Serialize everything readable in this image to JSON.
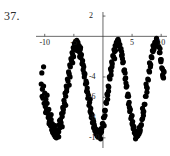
{
  "problem": {
    "number": "37."
  },
  "chart_data": {
    "type": "scatter",
    "title": "",
    "xlabel": "",
    "ylabel": "",
    "xlim": [
      -11.5,
      11.0
    ],
    "ylim": [
      -11.0,
      2.4
    ],
    "grid": false,
    "legend": null,
    "axis_lines": {
      "x_axis_at_y": 0,
      "y_axis_at_x": 0
    },
    "xticks": [
      -10,
      -5,
      5,
      10
    ],
    "xtick_labels": [
      "-10",
      "-5",
      "5",
      "10"
    ],
    "yticks": [
      2,
      -4,
      -6,
      -8,
      -10
    ],
    "ytick_labels": [
      "2",
      "-4",
      "-6",
      "-8",
      "-10"
    ],
    "marker": {
      "shape": "circle",
      "color": "#000000",
      "size": 2.6
    },
    "model": {
      "form": "a*sin(b*x + c) + d",
      "amplitude": 5,
      "period": 5,
      "offset": -5
    },
    "points": [
      [
        -10.6,
        -4.7
      ],
      [
        -10.5,
        -3.6
      ],
      [
        -10.4,
        -5.2
      ],
      [
        -10.3,
        -6.1
      ],
      [
        -10.2,
        -4.9
      ],
      [
        -10.1,
        -6.6
      ],
      [
        -10.0,
        -5.6
      ],
      [
        -9.9,
        -6.9
      ],
      [
        -9.8,
        -6.2
      ],
      [
        -9.7,
        -7.3
      ],
      [
        -9.6,
        -6.6
      ],
      [
        -9.5,
        -7.6
      ],
      [
        -9.4,
        -8.0
      ],
      [
        -9.3,
        -7.2
      ],
      [
        -9.2,
        -8.4
      ],
      [
        -9.1,
        -7.9
      ],
      [
        -9.0,
        -8.8
      ],
      [
        -8.9,
        -8.2
      ],
      [
        -8.8,
        -9.2
      ],
      [
        -8.7,
        -8.6
      ],
      [
        -8.6,
        -9.5
      ],
      [
        -8.5,
        -9.0
      ],
      [
        -8.4,
        -9.7
      ],
      [
        -8.3,
        -9.3
      ],
      [
        -8.2,
        -9.9
      ],
      [
        -8.1,
        -9.4
      ],
      [
        -8.0,
        -10.0
      ],
      [
        -7.9,
        -9.6
      ],
      [
        -7.8,
        -9.8
      ],
      [
        -7.7,
        -9.2
      ],
      [
        -7.6,
        -9.4
      ],
      [
        -7.5,
        -8.7
      ],
      [
        -7.4,
        -9.0
      ],
      [
        -7.3,
        -8.2
      ],
      [
        -7.2,
        -8.5
      ],
      [
        -7.1,
        -7.6
      ],
      [
        -7.0,
        -7.9
      ],
      [
        -6.9,
        -7.0
      ],
      [
        -6.8,
        -7.2
      ],
      [
        -6.7,
        -6.3
      ],
      [
        -6.6,
        -6.6
      ],
      [
        -6.5,
        -5.6
      ],
      [
        -6.4,
        -5.9
      ],
      [
        -6.3,
        -4.9
      ],
      [
        -6.2,
        -5.1
      ],
      [
        -6.1,
        -4.2
      ],
      [
        -6.0,
        -4.4
      ],
      [
        -5.9,
        -3.5
      ],
      [
        -5.8,
        -3.7
      ],
      [
        -5.7,
        -2.8
      ],
      [
        -5.6,
        -3.0
      ],
      [
        -5.5,
        -2.2
      ],
      [
        -5.4,
        -2.4
      ],
      [
        -5.3,
        -1.6
      ],
      [
        -5.2,
        -1.8
      ],
      [
        -5.1,
        -1.1
      ],
      [
        -5.0,
        -1.3
      ],
      [
        -4.9,
        -0.7
      ],
      [
        -4.8,
        -0.9
      ],
      [
        -4.7,
        -0.5
      ],
      [
        -4.6,
        -0.8
      ],
      [
        -4.5,
        -0.4
      ],
      [
        -4.4,
        -0.9
      ],
      [
        -4.3,
        -0.6
      ],
      [
        -4.2,
        -1.2
      ],
      [
        -4.1,
        -0.9
      ],
      [
        -4.0,
        -1.6
      ],
      [
        -3.9,
        -1.3
      ],
      [
        -3.8,
        -2.1
      ],
      [
        -3.7,
        -1.8
      ],
      [
        -3.6,
        -2.7
      ],
      [
        -3.5,
        -2.4
      ],
      [
        -3.4,
        -3.3
      ],
      [
        -3.3,
        -3.0
      ],
      [
        -3.2,
        -4.0
      ],
      [
        -3.1,
        -3.7
      ],
      [
        -3.0,
        -4.7
      ],
      [
        -2.9,
        -4.4
      ],
      [
        -2.8,
        -5.4
      ],
      [
        -2.7,
        -5.1
      ],
      [
        -2.6,
        -6.1
      ],
      [
        -2.5,
        -5.8
      ],
      [
        -2.4,
        -6.8
      ],
      [
        -2.3,
        -6.5
      ],
      [
        -2.2,
        -7.4
      ],
      [
        -2.1,
        -7.1
      ],
      [
        -2.0,
        -8.0
      ],
      [
        -1.9,
        -7.7
      ],
      [
        -1.8,
        -8.5
      ],
      [
        -1.7,
        -8.2
      ],
      [
        -1.6,
        -9.0
      ],
      [
        -1.5,
        -8.7
      ],
      [
        -1.4,
        -9.3
      ],
      [
        -1.3,
        -9.1
      ],
      [
        -1.2,
        -9.6
      ],
      [
        -1.1,
        -9.4
      ],
      [
        -1.0,
        -9.8
      ],
      [
        -0.9,
        -9.6
      ],
      [
        -0.8,
        -9.9
      ],
      [
        -0.7,
        -9.7
      ],
      [
        -0.6,
        -9.8
      ],
      [
        -0.5,
        -9.5
      ],
      [
        -0.4,
        -9.5
      ],
      [
        -0.3,
        -9.1
      ],
      [
        -0.2,
        -9.1
      ],
      [
        -0.1,
        -8.6
      ],
      [
        0.0,
        -8.6
      ],
      [
        0.1,
        -8.0
      ],
      [
        0.2,
        -8.0
      ],
      [
        0.3,
        -7.3
      ],
      [
        0.4,
        -7.3
      ],
      [
        0.5,
        -6.5
      ],
      [
        0.6,
        -6.6
      ],
      [
        0.7,
        -5.7
      ],
      [
        0.8,
        -5.8
      ],
      [
        0.9,
        -4.9
      ],
      [
        1.0,
        -5.0
      ],
      [
        1.1,
        -4.0
      ],
      [
        1.2,
        -4.2
      ],
      [
        1.3,
        -3.2
      ],
      [
        1.4,
        -3.4
      ],
      [
        1.5,
        -2.5
      ],
      [
        1.6,
        -2.7
      ],
      [
        1.7,
        -1.9
      ],
      [
        1.8,
        -2.0
      ],
      [
        1.9,
        -1.3
      ],
      [
        2.0,
        -1.5
      ],
      [
        2.1,
        -0.9
      ],
      [
        2.2,
        -1.0
      ],
      [
        2.3,
        -0.6
      ],
      [
        2.4,
        -0.7
      ],
      [
        2.5,
        -0.4
      ],
      [
        2.6,
        -0.6
      ],
      [
        2.7,
        -0.5
      ],
      [
        2.8,
        -0.8
      ],
      [
        2.9,
        -0.8
      ],
      [
        3.0,
        -1.3
      ],
      [
        3.1,
        -1.2
      ],
      [
        3.2,
        -1.9
      ],
      [
        3.3,
        -1.8
      ],
      [
        3.4,
        -2.6
      ],
      [
        3.5,
        -2.5
      ],
      [
        3.6,
        -3.4
      ],
      [
        3.7,
        -3.3
      ],
      [
        3.8,
        -4.2
      ],
      [
        3.9,
        -4.1
      ],
      [
        4.0,
        -5.0
      ],
      [
        4.1,
        -4.9
      ],
      [
        4.2,
        -5.9
      ],
      [
        4.3,
        -5.7
      ],
      [
        4.4,
        -6.7
      ],
      [
        4.5,
        -6.5
      ],
      [
        4.6,
        -7.4
      ],
      [
        4.7,
        -7.2
      ],
      [
        4.8,
        -8.1
      ],
      [
        4.9,
        -7.9
      ],
      [
        5.0,
        -8.6
      ],
      [
        5.1,
        -8.4
      ],
      [
        5.2,
        -9.1
      ],
      [
        5.3,
        -8.9
      ],
      [
        5.4,
        -9.5
      ],
      [
        5.5,
        -9.3
      ],
      [
        5.6,
        -9.7
      ],
      [
        5.7,
        -9.5
      ],
      [
        5.8,
        -9.9
      ],
      [
        5.9,
        -9.7
      ],
      [
        6.0,
        -9.8
      ],
      [
        6.1,
        -9.6
      ],
      [
        6.2,
        -9.6
      ],
      [
        6.3,
        -9.3
      ],
      [
        6.4,
        -9.2
      ],
      [
        6.5,
        -8.8
      ],
      [
        6.6,
        -8.7
      ],
      [
        6.7,
        -8.2
      ],
      [
        6.8,
        -8.1
      ],
      [
        6.9,
        -7.5
      ],
      [
        7.0,
        -7.4
      ],
      [
        7.1,
        -6.7
      ],
      [
        7.2,
        -6.7
      ],
      [
        7.3,
        -5.9
      ],
      [
        7.4,
        -5.9
      ],
      [
        7.5,
        -5.0
      ],
      [
        7.6,
        -5.1
      ],
      [
        7.7,
        -4.2
      ],
      [
        7.8,
        -4.3
      ],
      [
        7.9,
        -3.4
      ],
      [
        8.0,
        -3.5
      ],
      [
        8.1,
        -2.7
      ],
      [
        8.2,
        -2.8
      ],
      [
        8.3,
        -2.0
      ],
      [
        8.4,
        -2.1
      ],
      [
        8.5,
        -1.4
      ],
      [
        8.6,
        -1.5
      ],
      [
        8.7,
        -1.0
      ],
      [
        8.8,
        -1.1
      ],
      [
        8.9,
        -0.6
      ],
      [
        9.0,
        -0.7
      ],
      [
        9.1,
        -0.5
      ],
      [
        9.2,
        -0.5
      ],
      [
        9.3,
        -0.6
      ],
      [
        9.4,
        -0.6
      ],
      [
        9.5,
        -1.0
      ],
      [
        9.6,
        -1.0
      ],
      [
        9.7,
        -1.6
      ],
      [
        9.8,
        -1.6
      ],
      [
        9.9,
        -2.3
      ],
      [
        10.0,
        -2.3
      ],
      [
        10.1,
        -3.1
      ],
      [
        10.2,
        -3.2
      ],
      [
        10.3,
        -4.0
      ],
      [
        10.4,
        -4.1
      ],
      [
        10.5,
        -3.5
      ],
      [
        -10.45,
        -5.9
      ],
      [
        -9.85,
        -7.5
      ],
      [
        -9.25,
        -8.6
      ],
      [
        -8.65,
        -9.4
      ],
      [
        -8.05,
        -9.3
      ],
      [
        -7.45,
        -8.3
      ],
      [
        -6.85,
        -7.5
      ],
      [
        -6.25,
        -5.4
      ],
      [
        -5.65,
        -4.0
      ],
      [
        -5.05,
        -2.0
      ],
      [
        -4.45,
        -1.4
      ],
      [
        -3.85,
        -1.1
      ],
      [
        -3.25,
        -3.6
      ],
      [
        -2.65,
        -5.5
      ],
      [
        -2.05,
        -7.6
      ],
      [
        -1.45,
        -8.9
      ],
      [
        -0.85,
        -9.9
      ],
      [
        -0.25,
        -9.4
      ],
      [
        0.35,
        -7.8
      ],
      [
        0.95,
        -5.4
      ],
      [
        1.55,
        -3.0
      ],
      [
        2.15,
        -1.4
      ],
      [
        2.75,
        -0.9
      ],
      [
        3.35,
        -2.2
      ],
      [
        3.95,
        -4.6
      ],
      [
        4.55,
        -7.0
      ],
      [
        5.15,
        -8.8
      ],
      [
        5.75,
        -9.8
      ],
      [
        6.35,
        -9.4
      ],
      [
        6.95,
        -7.8
      ],
      [
        7.55,
        -5.5
      ],
      [
        8.15,
        -3.0
      ],
      [
        8.75,
        -1.3
      ],
      [
        9.35,
        -0.8
      ],
      [
        9.95,
        -2.5
      ],
      [
        10.25,
        -3.8
      ],
      [
        -10.2,
        -3.0
      ],
      [
        -9.6,
        -5.8
      ],
      [
        -8.9,
        -7.7
      ],
      [
        -8.2,
        -8.8
      ],
      [
        -7.6,
        -9.9
      ],
      [
        -7.0,
        -8.9
      ],
      [
        -6.4,
        -6.8
      ],
      [
        -5.8,
        -4.8
      ],
      [
        -5.2,
        -2.6
      ],
      [
        -4.6,
        -1.0
      ],
      [
        -4.0,
        -2.0
      ],
      [
        -3.4,
        -2.8
      ],
      [
        -2.8,
        -4.6
      ],
      [
        -2.2,
        -6.2
      ],
      [
        -1.6,
        -8.4
      ],
      [
        -1.0,
        -9.2
      ],
      [
        -0.4,
        -10.1
      ],
      [
        0.2,
        -8.8
      ],
      [
        0.8,
        -6.2
      ],
      [
        1.4,
        -3.8
      ],
      [
        2.0,
        -2.2
      ],
      [
        2.6,
        -0.3
      ],
      [
        3.2,
        -1.5
      ],
      [
        3.8,
        -3.6
      ],
      [
        4.4,
        -5.9
      ],
      [
        5.0,
        -7.8
      ],
      [
        5.6,
        -10.1
      ],
      [
        6.2,
        -9.0
      ],
      [
        6.8,
        -7.1
      ],
      [
        7.4,
        -4.7
      ],
      [
        8.0,
        -2.6
      ],
      [
        8.6,
        -0.9
      ],
      [
        9.2,
        -0.2
      ],
      [
        9.8,
        -1.2
      ],
      [
        10.4,
        -3.4
      ]
    ]
  }
}
